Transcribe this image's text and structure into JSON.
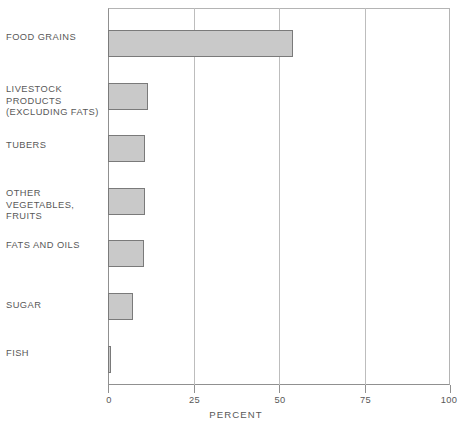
{
  "chart_data": {
    "type": "bar",
    "orientation": "horizontal",
    "title": "",
    "xlabel": "PERCENT",
    "ylabel": "",
    "xlim": [
      0,
      100
    ],
    "xticks": [
      0,
      25,
      50,
      75,
      100
    ],
    "xticklabels": [
      "0",
      "25",
      "50",
      "75",
      "100"
    ],
    "grid": true,
    "gridlines_at": [
      25,
      50,
      75
    ],
    "legend": null,
    "categories": [
      "FOOD GRAINS",
      "LIVESTOCK\nPRODUCTS\n(EXCLUDING FATS)",
      "TUBERS",
      "OTHER\nVEGETABLES,\n FRUITS",
      "FATS AND OILS",
      "SUGAR",
      "FISH"
    ],
    "values": [
      54,
      11.7,
      10.8,
      10.8,
      10.5,
      7.3,
      1.0
    ],
    "bar_color": "#c9c9c9",
    "bar_edge_color": "#7a7a7a"
  },
  "axis": {
    "xlabel": "PERCENT",
    "ticks": [
      {
        "value": 0,
        "label": "0"
      },
      {
        "value": 25,
        "label": "25"
      },
      {
        "value": 50,
        "label": "50"
      },
      {
        "value": 75,
        "label": "75"
      },
      {
        "value": 100,
        "label": "100"
      }
    ]
  },
  "bars": [
    {
      "label": "FOOD GRAINS",
      "value": 54,
      "top": 30
    },
    {
      "label": "LIVESTOCK\nPRODUCTS\n(EXCLUDING FATS)",
      "value": 11.7,
      "top": 83
    },
    {
      "label": "TUBERS",
      "value": 10.8,
      "top": 135
    },
    {
      "label": "OTHER\nVEGETABLES,\n FRUITS",
      "value": 10.8,
      "top": 188
    },
    {
      "label": "FATS AND OILS",
      "value": 10.5,
      "top": 240
    },
    {
      "label": "SUGAR",
      "value": 7.3,
      "top": 293
    },
    {
      "label": "FISH",
      "value": 1.0,
      "top": 346
    }
  ],
  "labels": [
    {
      "text": "FOOD GRAINS",
      "top": 32
    },
    {
      "text": "LIVESTOCK\nPRODUCTS\n(EXCLUDING FATS)",
      "top": 84
    },
    {
      "text": "TUBERS",
      "top": 140
    },
    {
      "text": "OTHER\nVEGETABLES,\n FRUITS",
      "top": 188
    },
    {
      "text": "FATS AND OILS",
      "top": 240
    },
    {
      "text": "SUGAR",
      "top": 300
    },
    {
      "text": "FISH",
      "top": 348
    }
  ]
}
